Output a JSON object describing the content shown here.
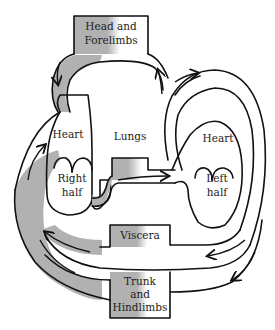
{
  "diagram": {
    "type": "circulatory-system-schematic",
    "colors": {
      "deoxygenated": "#b1b1b1",
      "oxygenated": "#ffffff",
      "outline": "#111111"
    },
    "nodes": {
      "head": {
        "line1": "Head and",
        "line2": "Forelimbs"
      },
      "lungs": {
        "label": "Lungs"
      },
      "right_heart": {
        "line1": "Heart",
        "line2": "Right",
        "line3": "half"
      },
      "left_heart": {
        "line1": "Heart",
        "line2": "Left",
        "line3": "half"
      },
      "viscera": {
        "label": "Viscera"
      },
      "trunk": {
        "line1": "Trunk",
        "line2": "and",
        "line3": "Hindlimbs"
      }
    },
    "edges": [
      {
        "from": "Head and Forelimbs",
        "to": "Heart (Right half)"
      },
      {
        "from": "Heart (Right half)",
        "to": "Lungs"
      },
      {
        "from": "Lungs",
        "to": "Heart (Left half)"
      },
      {
        "from": "Heart (Left half)",
        "to": "Head and Forelimbs"
      },
      {
        "from": "Heart (Left half)",
        "to": "Viscera"
      },
      {
        "from": "Heart (Left half)",
        "to": "Trunk and Hindlimbs"
      },
      {
        "from": "Viscera",
        "to": "Heart (Right half)"
      },
      {
        "from": "Trunk and Hindlimbs",
        "to": "Heart (Right half)"
      }
    ]
  }
}
